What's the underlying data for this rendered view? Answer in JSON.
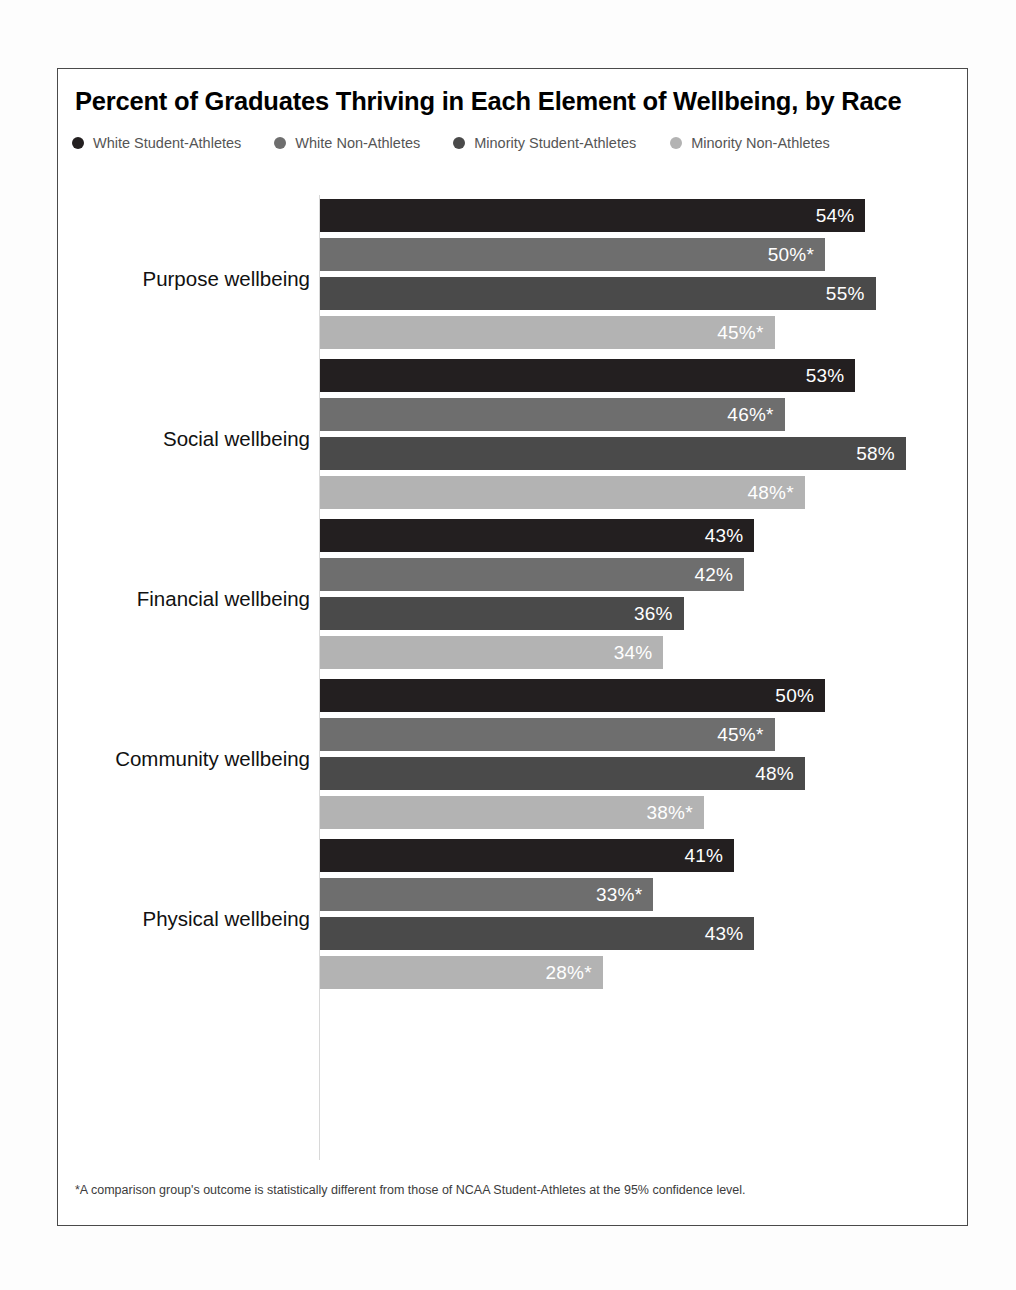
{
  "chart_data": {
    "type": "bar",
    "orientation": "horizontal",
    "title": "Percent of Graduates Thriving in Each Element of Wellbeing, by Race",
    "xlabel": "",
    "ylabel": "",
    "xlim": [
      0,
      60
    ],
    "grid": false,
    "legend_position": "top-left",
    "categories": [
      "Purpose wellbeing",
      "Social wellbeing",
      "Financial wellbeing",
      "Community wellbeing",
      "Physical wellbeing"
    ],
    "series": [
      {
        "name": "White Student-Athletes",
        "color": "#231f20",
        "values": [
          54,
          53,
          43,
          50,
          41
        ],
        "labels": [
          "54%",
          "53%",
          "43%",
          "50%",
          "41%"
        ]
      },
      {
        "name": "White Non-Athletes",
        "color": "#6e6e6e",
        "values": [
          50,
          46,
          42,
          45,
          33
        ],
        "labels": [
          "50%*",
          "46%*",
          "42%",
          "45%*",
          "33%*"
        ]
      },
      {
        "name": "Minority Student-Athletes",
        "color": "#4a4a4a",
        "values": [
          55,
          58,
          36,
          48,
          43
        ],
        "labels": [
          "55%",
          "58%",
          "36%",
          "48%",
          "43%"
        ]
      },
      {
        "name": "Minority Non-Athletes",
        "color": "#b3b3b3",
        "values": [
          45,
          48,
          34,
          38,
          28
        ],
        "labels": [
          "45%*",
          "48%*",
          "34%",
          "38%*",
          "28%*"
        ]
      }
    ],
    "footnote": "*A comparison group's outcome is statistically different from those of NCAA Student-Athletes at the 95% confidence level."
  },
  "legend": {
    "items": [
      {
        "label": "White Student-Athletes",
        "color": "#231f20"
      },
      {
        "label": "White Non-Athletes",
        "color": "#6e6e6e"
      },
      {
        "label": "Minority Student-Athletes",
        "color": "#4a4a4a"
      },
      {
        "label": "Minority Non-Athletes",
        "color": "#b3b3b3"
      }
    ]
  }
}
